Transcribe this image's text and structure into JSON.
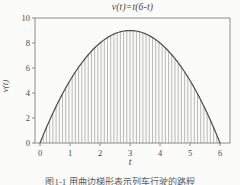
{
  "figure": {
    "y_axis_label": "v(t)",
    "x_axis_label": "t",
    "caption": "图1-1 用曲边梯形表示列车行驶的路程"
  },
  "colors": {
    "background": "#fbfbfa",
    "axis": "#8c8c8c",
    "tick_text": "#4a4a4a",
    "curve": "#4a4a4a",
    "hatch": "#9c9c9c"
  },
  "chart_data": {
    "type": "line",
    "title": "v(t)=t(6-t)",
    "xlabel": "t",
    "ylabel": "v(t)",
    "function": "v(t) = t(6 - t)",
    "coeffs": {
      "a": -1,
      "b": 6,
      "c": 0
    },
    "t_range": [
      0,
      6
    ],
    "points": [
      [
        0,
        0
      ],
      [
        1,
        5
      ],
      [
        2,
        8
      ],
      [
        3,
        9
      ],
      [
        4,
        8
      ],
      [
        5,
        5
      ],
      [
        6,
        0
      ]
    ],
    "peak": [
      3,
      9
    ],
    "x_ticks": [
      0,
      1,
      2,
      3,
      4,
      5,
      6
    ],
    "y_ticks": [
      0,
      2,
      4,
      6,
      8,
      10
    ],
    "xlim": [
      -0.167,
      6.333
    ],
    "ylim": [
      0,
      10
    ],
    "grid": false,
    "legend": "none",
    "hatch": {
      "style": "vertical-lines",
      "count": 55,
      "t_start": 0.107,
      "t_end": 5.893
    }
  }
}
